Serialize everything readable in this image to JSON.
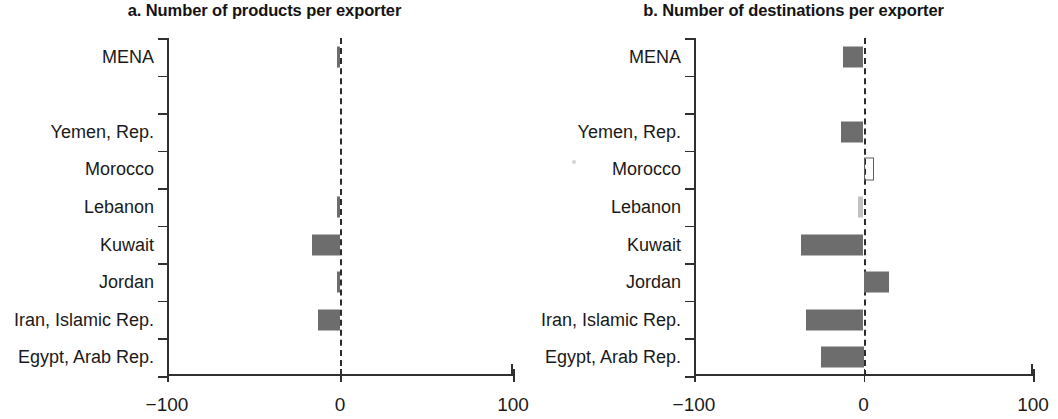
{
  "figure": {
    "background_color": "#ffffff",
    "bar_color": "#6d6d6d",
    "axis_color": "#303030",
    "zero_line_color": "#2b2b2b"
  },
  "panels": [
    {
      "id": "a",
      "title": "a. Number of products per exporter"
    },
    {
      "id": "b",
      "title": "b. Number of destinations per exporter"
    }
  ],
  "axis": {
    "x_tick_labels": [
      "−100",
      "0",
      "100"
    ],
    "x_tick_values": [
      -100,
      0,
      100
    ]
  },
  "categories": [
    "MENA",
    "",
    "Yemen, Rep.",
    "Morocco",
    "Lebanon",
    "Kuwait",
    "Jordan",
    "Iran, Islamic Rep.",
    "Egypt, Arab Rep."
  ],
  "chart_data": [
    {
      "type": "bar",
      "orientation": "horizontal",
      "panel": "a",
      "title": "a. Number of products per exporter",
      "xlabel": "",
      "ylabel": "",
      "xlim": [
        -100,
        100
      ],
      "xticks": [
        -100,
        0,
        100
      ],
      "xticklabels": [
        "−100",
        "0",
        "100"
      ],
      "grid": false,
      "legend": "none",
      "zero_reference_line": 0,
      "categories": [
        "MENA",
        "Yemen, Rep.",
        "Morocco",
        "Lebanon",
        "Kuwait",
        "Jordan",
        "Iran, Islamic Rep.",
        "Egypt, Arab Rep."
      ],
      "values": [
        -2,
        0,
        0,
        -2,
        -16,
        -2,
        -13,
        0
      ]
    },
    {
      "type": "bar",
      "orientation": "horizontal",
      "panel": "b",
      "title": "b. Number of destinations per exporter",
      "xlabel": "",
      "ylabel": "",
      "xlim": [
        -100,
        100
      ],
      "xticks": [
        -100,
        0,
        100
      ],
      "xticklabels": [
        "−100",
        "0",
        "100"
      ],
      "grid": false,
      "legend": "none",
      "zero_reference_line": 0,
      "categories": [
        "MENA",
        "Yemen, Rep.",
        "Morocco",
        "Lebanon",
        "Kuwait",
        "Jordan",
        "Iran, Islamic Rep.",
        "Egypt, Arab Rep."
      ],
      "values": [
        -12,
        -13,
        5,
        -3,
        -37,
        15,
        -34,
        -25
      ]
    }
  ]
}
